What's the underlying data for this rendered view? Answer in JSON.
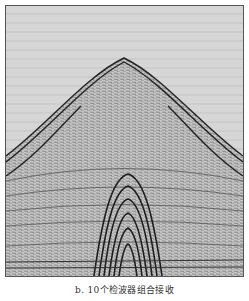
{
  "figure": {
    "background_color": "#d4d4d4",
    "trace_color": "#2a2a2a"
  },
  "caption": {
    "text": "b. 10个检波器组合接收"
  }
}
